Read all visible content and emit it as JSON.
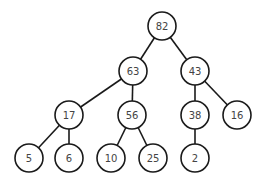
{
  "diagram": {
    "type": "binary-tree",
    "radius": 14,
    "colors": {
      "stroke": "#1a1a1a",
      "fill": "#ffffff",
      "text": "#444444"
    },
    "nodes": [
      {
        "id": "n82",
        "label": "82",
        "x": 162,
        "y": 26
      },
      {
        "id": "n63",
        "label": "63",
        "x": 133,
        "y": 71
      },
      {
        "id": "n43",
        "label": "43",
        "x": 195,
        "y": 71
      },
      {
        "id": "n17",
        "label": "17",
        "x": 69,
        "y": 115
      },
      {
        "id": "n56",
        "label": "56",
        "x": 132,
        "y": 115
      },
      {
        "id": "n38",
        "label": "38",
        "x": 195,
        "y": 115
      },
      {
        "id": "n16",
        "label": "16",
        "x": 237,
        "y": 115
      },
      {
        "id": "n5",
        "label": "5",
        "x": 29,
        "y": 158
      },
      {
        "id": "n6",
        "label": "6",
        "x": 69,
        "y": 158
      },
      {
        "id": "n10",
        "label": "10",
        "x": 111,
        "y": 158
      },
      {
        "id": "n25",
        "label": "25",
        "x": 153,
        "y": 158
      },
      {
        "id": "n2",
        "label": "2",
        "x": 195,
        "y": 158
      }
    ],
    "edges": [
      [
        "n82",
        "n63"
      ],
      [
        "n82",
        "n43"
      ],
      [
        "n63",
        "n17"
      ],
      [
        "n63",
        "n56"
      ],
      [
        "n43",
        "n38"
      ],
      [
        "n43",
        "n16"
      ],
      [
        "n17",
        "n5"
      ],
      [
        "n17",
        "n6"
      ],
      [
        "n56",
        "n10"
      ],
      [
        "n56",
        "n25"
      ],
      [
        "n38",
        "n2"
      ]
    ]
  }
}
